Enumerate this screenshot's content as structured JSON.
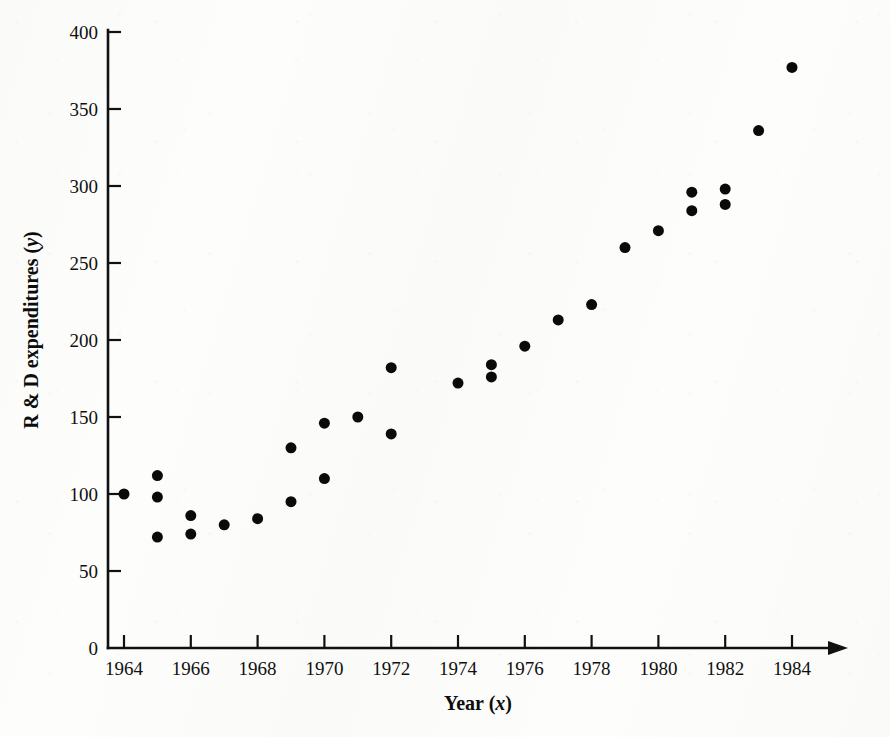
{
  "chart_data": {
    "type": "scatter",
    "title": "",
    "xlabel": "Year (x)",
    "ylabel": "R & D expenditures (y)",
    "xlabel_text": "Year",
    "xlabel_var": "x",
    "ylabel_text": "R & D expenditures",
    "ylabel_var": "y",
    "xlim": [
      1963.2,
      1984.8
    ],
    "ylim": [
      0,
      400
    ],
    "grid": false,
    "legend": null,
    "x_tick_labels": [
      "1964",
      "1966",
      "1968",
      "1970",
      "1972",
      "1974",
      "1976",
      "1978",
      "1980",
      "1982",
      "1984"
    ],
    "x_ticks": [
      1964,
      1965,
      1966,
      1967,
      1968,
      1969,
      1970,
      1971,
      1972,
      1973,
      1974,
      1975,
      1976,
      1977,
      1978,
      1979,
      1980,
      1981,
      1982,
      1983,
      1984
    ],
    "x_major_ticks": [
      1964,
      1966,
      1968,
      1970,
      1972,
      1974,
      1976,
      1978,
      1980,
      1982,
      1984
    ],
    "y_tick_labels": [
      "0",
      "50",
      "100",
      "150",
      "200",
      "250",
      "300",
      "350",
      "400"
    ],
    "y_ticks": [
      0,
      50,
      100,
      150,
      200,
      250,
      300,
      350,
      400
    ],
    "marker": "filled-circle",
    "marker_color": "#0a0a0a",
    "marker_size_px": 11,
    "points": [
      {
        "x": 1964,
        "y": 100
      },
      {
        "x": 1965,
        "y": 112
      },
      {
        "x": 1965,
        "y": 98
      },
      {
        "x": 1965,
        "y": 72
      },
      {
        "x": 1966,
        "y": 86
      },
      {
        "x": 1966,
        "y": 74
      },
      {
        "x": 1967,
        "y": 80
      },
      {
        "x": 1968,
        "y": 84
      },
      {
        "x": 1969,
        "y": 130
      },
      {
        "x": 1969,
        "y": 95
      },
      {
        "x": 1970,
        "y": 146
      },
      {
        "x": 1970,
        "y": 110
      },
      {
        "x": 1971,
        "y": 150
      },
      {
        "x": 1972,
        "y": 182
      },
      {
        "x": 1972,
        "y": 139
      },
      {
        "x": 1974,
        "y": 172
      },
      {
        "x": 1975,
        "y": 184
      },
      {
        "x": 1975,
        "y": 176
      },
      {
        "x": 1976,
        "y": 196
      },
      {
        "x": 1977,
        "y": 213
      },
      {
        "x": 1978,
        "y": 223
      },
      {
        "x": 1979,
        "y": 260
      },
      {
        "x": 1980,
        "y": 271
      },
      {
        "x": 1981,
        "y": 296
      },
      {
        "x": 1981,
        "y": 284
      },
      {
        "x": 1982,
        "y": 298
      },
      {
        "x": 1982,
        "y": 288
      },
      {
        "x": 1983,
        "y": 336
      },
      {
        "x": 1984,
        "y": 377
      }
    ]
  },
  "figure": {
    "x_axis_name": "x-axis",
    "y_axis_name": "y-axis",
    "background_color": "#fdfdfc",
    "ink_color": "#111111"
  }
}
